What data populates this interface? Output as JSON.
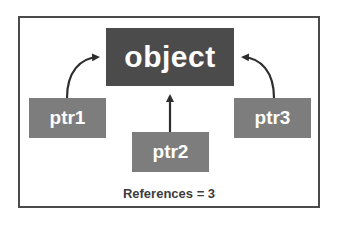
{
  "diagram": {
    "object": {
      "label": "object"
    },
    "pointers": [
      {
        "label": "ptr1"
      },
      {
        "label": "ptr2"
      },
      {
        "label": "ptr3"
      }
    ],
    "caption": "References = 3",
    "colors": {
      "object_fill": "#4b4b4b",
      "pointer_fill": "#7d7d7d",
      "arrow": "#2e2e2e",
      "frame": "#4a4a4a",
      "text_light": "#ffffff",
      "caption_text": "#3c3c3c"
    }
  }
}
